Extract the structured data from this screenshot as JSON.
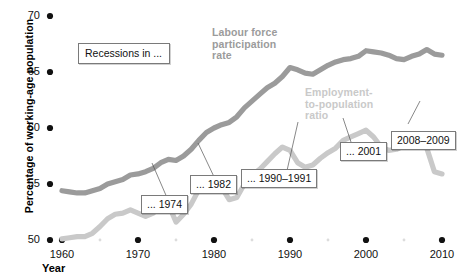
{
  "chart_data": {
    "type": "line",
    "title": "",
    "xlabel": "Year",
    "ylabel": "Percentage of working-age population",
    "xlim": [
      1960,
      2010
    ],
    "ylim": [
      50,
      70
    ],
    "grid": false,
    "legend_position": "inline-labels",
    "xticks": [
      1960,
      1970,
      1980,
      1990,
      2000,
      2010
    ],
    "xtick_labels": [
      "1960",
      "1970",
      "1980",
      "1990",
      "2000",
      "2010"
    ],
    "xminorticks": [
      1965,
      1975,
      1985,
      1995,
      2005
    ],
    "yticks": [
      50,
      55,
      60,
      65,
      70
    ],
    "ytick_labels": [
      "50",
      "55",
      "60",
      "65",
      "70"
    ],
    "series": [
      {
        "name": "Labour force participation rate",
        "color": "#9b9b9b",
        "x": [
          1960,
          1961,
          1962,
          1963,
          1964,
          1965,
          1966,
          1967,
          1968,
          1969,
          1970,
          1971,
          1972,
          1973,
          1974,
          1975,
          1976,
          1977,
          1978,
          1979,
          1980,
          1981,
          1982,
          1983,
          1984,
          1985,
          1986,
          1987,
          1988,
          1989,
          1990,
          1991,
          1992,
          1993,
          1994,
          1995,
          1996,
          1997,
          1998,
          1999,
          2000,
          2001,
          2002,
          2003,
          2004,
          2005,
          2006,
          2007,
          2008,
          2009,
          2010
        ],
        "y": [
          54.4,
          54.3,
          54.2,
          54.2,
          54.4,
          54.6,
          55.0,
          55.2,
          55.4,
          55.8,
          55.9,
          56.1,
          56.4,
          56.9,
          57.2,
          57.1,
          57.5,
          58.1,
          58.9,
          59.6,
          60.0,
          60.3,
          60.5,
          61.0,
          61.8,
          62.4,
          63.0,
          63.6,
          64.0,
          64.6,
          65.4,
          65.2,
          64.9,
          64.8,
          65.2,
          65.6,
          65.9,
          66.1,
          66.2,
          66.4,
          66.9,
          66.8,
          66.7,
          66.5,
          66.2,
          66.1,
          66.4,
          66.6,
          67.0,
          66.6,
          66.5
        ]
      },
      {
        "name": "Employment-to-population ratio",
        "color": "#c9c9c9",
        "x": [
          1960,
          1961,
          1962,
          1963,
          1964,
          1965,
          1966,
          1967,
          1968,
          1969,
          1970,
          1971,
          1972,
          1973,
          1974,
          1975,
          1976,
          1977,
          1978,
          1979,
          1980,
          1981,
          1982,
          1983,
          1984,
          1985,
          1986,
          1987,
          1988,
          1989,
          1990,
          1991,
          1992,
          1993,
          1994,
          1995,
          1996,
          1997,
          1998,
          1999,
          2000,
          2001,
          2002,
          2003,
          2004,
          2005,
          2006,
          2007,
          2008,
          2009,
          2010
        ],
        "y": [
          50.1,
          50.2,
          50.3,
          50.3,
          50.6,
          51.2,
          51.9,
          52.3,
          52.4,
          52.7,
          52.4,
          52.1,
          52.4,
          53.1,
          53.2,
          51.6,
          52.3,
          53.2,
          54.5,
          55.3,
          54.9,
          54.7,
          53.6,
          53.8,
          55.0,
          55.8,
          56.3,
          57.0,
          57.7,
          58.3,
          58.0,
          56.9,
          56.5,
          56.7,
          57.3,
          57.8,
          58.2,
          58.9,
          59.2,
          59.5,
          59.8,
          59.2,
          58.3,
          58.0,
          58.1,
          58.4,
          58.8,
          58.9,
          58.2,
          56.1,
          55.9
        ]
      }
    ],
    "annotations": [
      {
        "id": "recessions",
        "text": "Recessions in ..."
      },
      {
        "id": "r1974",
        "text": "... 1974"
      },
      {
        "id": "r1982",
        "text": "... 1982"
      },
      {
        "id": "r1990",
        "text": "... 1990–1991"
      },
      {
        "id": "r2001",
        "text": "... 2001"
      },
      {
        "id": "r2008",
        "text": "2008–2009"
      }
    ],
    "inline_labels": [
      {
        "id": "lfp",
        "text": "Labour force\nparticipation\nrate",
        "line1": "Labour force",
        "line2": "participation",
        "line3": "rate"
      },
      {
        "id": "epr",
        "text": "Employment-\nto-population\nratio",
        "line1": "Employment-",
        "line2": "to-population",
        "line3": "ratio"
      }
    ]
  },
  "axis": {
    "x_title": "Year",
    "y_title": "Percentage of working-age population",
    "y_labels": [
      "70",
      "65",
      "60",
      "55",
      "50"
    ],
    "x_labels": [
      "1960",
      "1970",
      "1980",
      "1990",
      "2000",
      "2010"
    ]
  },
  "labels": {
    "lfp_l1": "Labour force",
    "lfp_l2": "participation",
    "lfp_l3": "rate",
    "epr_l1": "Employment-",
    "epr_l2": "to-population",
    "epr_l3": "ratio"
  },
  "callouts": {
    "recessions": "Recessions in ...",
    "y1974": "... 1974",
    "y1982": "... 1982",
    "y1990": "... 1990–1991",
    "y2001": "... 2001",
    "y2008": "2008–2009"
  },
  "colors": {
    "lfp_line": "#9b9b9b",
    "epr_line": "#c9c9c9",
    "tick_dot": "#111111",
    "minor_dot": "#d8d8d8",
    "text": "#111111",
    "callout_border": "#7a7a7a"
  }
}
